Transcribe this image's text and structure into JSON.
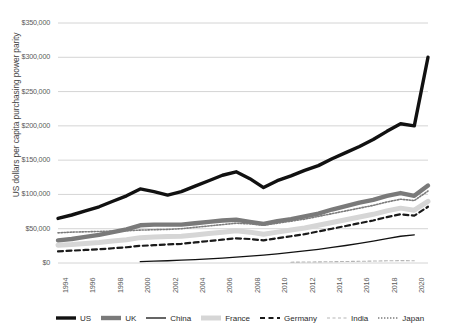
{
  "chart_data": {
    "type": "line",
    "title": "",
    "xlabel": "",
    "ylabel": "US dollars per capita purchasing power parity",
    "ylim": [
      0,
      350000
    ],
    "ytick_labels": [
      "$350,000",
      "$300,000",
      "$250,000",
      "$200,000",
      "$150,000",
      "$100,000",
      "$50,000",
      "$0"
    ],
    "ytick_values": [
      350000,
      300000,
      250000,
      200000,
      150000,
      100000,
      50000,
      0
    ],
    "xlim": [
      1994,
      2021
    ],
    "xtick_labels": [
      "1994",
      "1996",
      "1998",
      "2000",
      "2002",
      "2004",
      "2006",
      "2008",
      "2010",
      "2012",
      "2014",
      "2016",
      "2018",
      "2020"
    ],
    "xtick_values": [
      1994,
      1996,
      1998,
      2000,
      2002,
      2004,
      2006,
      2008,
      2010,
      2012,
      2014,
      2016,
      2018,
      2020
    ],
    "grid": true,
    "legend_position": "bottom",
    "x": [
      1994,
      1995,
      1996,
      1997,
      1998,
      1999,
      2000,
      2001,
      2002,
      2003,
      2004,
      2005,
      2006,
      2007,
      2008,
      2009,
      2010,
      2011,
      2012,
      2013,
      2014,
      2015,
      2016,
      2017,
      2018,
      2019,
      2020,
      2021
    ],
    "series": [
      {
        "name": "US",
        "color": "#111111",
        "style": "solid",
        "width": 3.4,
        "values": [
          65000,
          70000,
          76000,
          82000,
          90000,
          98000,
          108000,
          104000,
          99000,
          104000,
          112000,
          120000,
          128000,
          133000,
          123000,
          110000,
          120000,
          127000,
          135000,
          142000,
          152000,
          161000,
          170000,
          180000,
          192000,
          203000,
          200000,
          300000
        ]
      },
      {
        "name": "UK",
        "color": "#7a7a7a",
        "style": "solid",
        "width": 4.4,
        "values": [
          33000,
          35000,
          38000,
          41000,
          45000,
          49000,
          55000,
          56000,
          56000,
          56000,
          58000,
          60000,
          62000,
          63000,
          60000,
          57000,
          61000,
          64000,
          68000,
          72000,
          78000,
          83000,
          88000,
          92000,
          98000,
          102000,
          98000,
          113000
        ]
      },
      {
        "name": "China",
        "color": "#111111",
        "style": "solid",
        "width": 1.3,
        "values": [
          null,
          null,
          null,
          null,
          null,
          null,
          2000,
          2600,
          3300,
          4100,
          5000,
          6000,
          7200,
          8600,
          10000,
          11500,
          13300,
          15400,
          17600,
          20000,
          22800,
          25500,
          28500,
          31800,
          35500,
          39000,
          41000,
          null
        ]
      },
      {
        "name": "France",
        "color": "#d6d6d6",
        "style": "solid",
        "width": 5.0,
        "values": [
          26000,
          27000,
          28500,
          30000,
          32000,
          34000,
          37000,
          38000,
          38500,
          39000,
          41000,
          43000,
          45000,
          47000,
          45000,
          42000,
          45000,
          48000,
          51000,
          55000,
          59000,
          63000,
          67000,
          71000,
          76000,
          80000,
          77000,
          90000
        ]
      },
      {
        "name": "Germany",
        "color": "#1a1a1a",
        "style": "dashed",
        "width": 2.2,
        "values": [
          17000,
          18000,
          19000,
          20000,
          21500,
          23000,
          25000,
          26000,
          27000,
          28000,
          30000,
          32000,
          34000,
          36000,
          35000,
          33000,
          36000,
          39000,
          42000,
          46000,
          50000,
          54000,
          58000,
          62000,
          67000,
          71000,
          69000,
          82000
        ]
      },
      {
        "name": "India",
        "color": "#b5b5b5",
        "style": "dashed-thin",
        "width": 1.1,
        "values": [
          null,
          null,
          null,
          null,
          null,
          null,
          null,
          null,
          null,
          null,
          null,
          null,
          null,
          null,
          null,
          null,
          null,
          1200,
          1400,
          1600,
          1900,
          2200,
          2500,
          2800,
          3200,
          3500,
          3300,
          null
        ]
      },
      {
        "name": "Japan",
        "color": "#7c7c7c",
        "style": "dotted",
        "width": 1.6,
        "values": [
          44000,
          45000,
          45500,
          46000,
          46500,
          47000,
          48000,
          48500,
          49000,
          50000,
          52000,
          54000,
          56000,
          58000,
          57000,
          55000,
          58000,
          61000,
          64000,
          68000,
          72000,
          76000,
          80000,
          84000,
          89000,
          93000,
          91000,
          105000
        ]
      }
    ]
  },
  "legend": {
    "items": [
      {
        "label": "US",
        "marker": "thick-black-line"
      },
      {
        "label": "UK",
        "marker": "thick-gray-line"
      },
      {
        "label": "China",
        "marker": "thin-black-line"
      },
      {
        "label": "France",
        "marker": "thick-lightgray-line"
      },
      {
        "label": "Germany",
        "marker": "dashed-black-line"
      },
      {
        "label": "India",
        "marker": "thin-dashed-gray-line"
      },
      {
        "label": "Japan",
        "marker": "dotted-gray-line"
      }
    ]
  }
}
